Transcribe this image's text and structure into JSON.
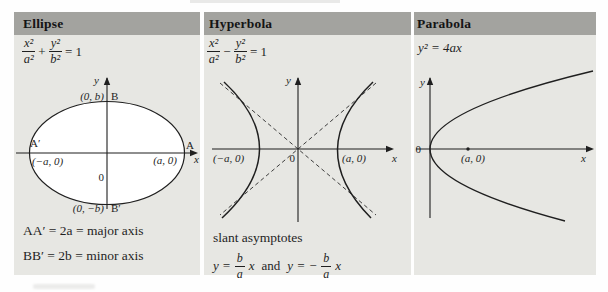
{
  "colors": {
    "page_bg": "#ffffff",
    "panel_bg": "#e7e7e3",
    "header_bg": "#a3a39f",
    "ink": "#1f1f1f"
  },
  "table": {
    "columns": [
      {
        "title": "Ellipse",
        "equation": {
          "n1": "x²",
          "d1": "a²",
          "op": "+",
          "n2": "y²",
          "d2": "b²",
          "rhs": "= 1"
        },
        "graph": {
          "y": "y",
          "x": "x",
          "origin": "0",
          "top_coord": "(0, b)",
          "top_vertex": "B",
          "bottom_coord": "(0, −b)",
          "bottom_vertex": "B′",
          "left_vertex": "A′",
          "left_coord": "(−a, 0)",
          "right_vertex": "A",
          "right_coord": "(a, 0)"
        },
        "notes": [
          "AA′ = 2a = major axis",
          "BB′ = 2b = minor axis"
        ]
      },
      {
        "title": "Hyperbola",
        "equation": {
          "n1": "x²",
          "d1": "a²",
          "op": "−",
          "n2": "y²",
          "d2": "b²",
          "rhs": "= 1"
        },
        "graph": {
          "y": "y",
          "x": "x",
          "origin": "0",
          "left_coord": "(−a, 0)",
          "right_coord": "(a, 0)"
        },
        "asymptotes": {
          "title": "slant asymptotes",
          "lhs1": "y =",
          "num1": "b",
          "den1": "a",
          "var1": "x",
          "conj": "and",
          "lhs2": "y = −",
          "num2": "b",
          "den2": "a",
          "var2": "x"
        }
      },
      {
        "title": "Parabola",
        "equation_text": "y² = 4ax",
        "graph": {
          "y": "y",
          "x": "x",
          "origin": "0",
          "focus_coord": "(a, 0)"
        }
      }
    ]
  }
}
